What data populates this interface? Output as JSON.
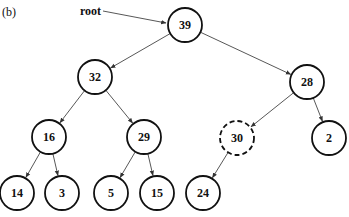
{
  "figure": {
    "panel_label": "(b)",
    "root_pointer_label": "root",
    "colors": {
      "stroke": "#111111",
      "edge": "#444444",
      "background": "#ffffff"
    }
  },
  "tree": {
    "nodes": [
      {
        "id": "n39",
        "value": "39",
        "x": 185,
        "y": 25,
        "style": "solid"
      },
      {
        "id": "n32",
        "value": "32",
        "x": 95,
        "y": 77,
        "style": "solid"
      },
      {
        "id": "n28",
        "value": "28",
        "x": 307,
        "y": 82,
        "style": "solid"
      },
      {
        "id": "n16",
        "value": "16",
        "x": 49,
        "y": 137,
        "style": "solid"
      },
      {
        "id": "n29",
        "value": "29",
        "x": 144,
        "y": 137,
        "style": "solid"
      },
      {
        "id": "n30",
        "value": "30",
        "x": 237,
        "y": 138,
        "style": "dashed"
      },
      {
        "id": "n2",
        "value": "2",
        "x": 329,
        "y": 138,
        "style": "solid"
      },
      {
        "id": "n14",
        "value": "14",
        "x": 17,
        "y": 193,
        "style": "solid"
      },
      {
        "id": "n3",
        "value": "3",
        "x": 62,
        "y": 193,
        "style": "solid"
      },
      {
        "id": "n5",
        "value": "5",
        "x": 111,
        "y": 193,
        "style": "solid"
      },
      {
        "id": "n15",
        "value": "15",
        "x": 157,
        "y": 193,
        "style": "solid"
      },
      {
        "id": "n24",
        "value": "24",
        "x": 203,
        "y": 193,
        "style": "solid"
      }
    ],
    "edges": [
      [
        "n39",
        "n32"
      ],
      [
        "n39",
        "n28"
      ],
      [
        "n32",
        "n16"
      ],
      [
        "n32",
        "n29"
      ],
      [
        "n28",
        "n30"
      ],
      [
        "n28",
        "n2"
      ],
      [
        "n16",
        "n14"
      ],
      [
        "n16",
        "n3"
      ],
      [
        "n29",
        "n5"
      ],
      [
        "n29",
        "n15"
      ],
      [
        "n30",
        "n24"
      ]
    ]
  }
}
